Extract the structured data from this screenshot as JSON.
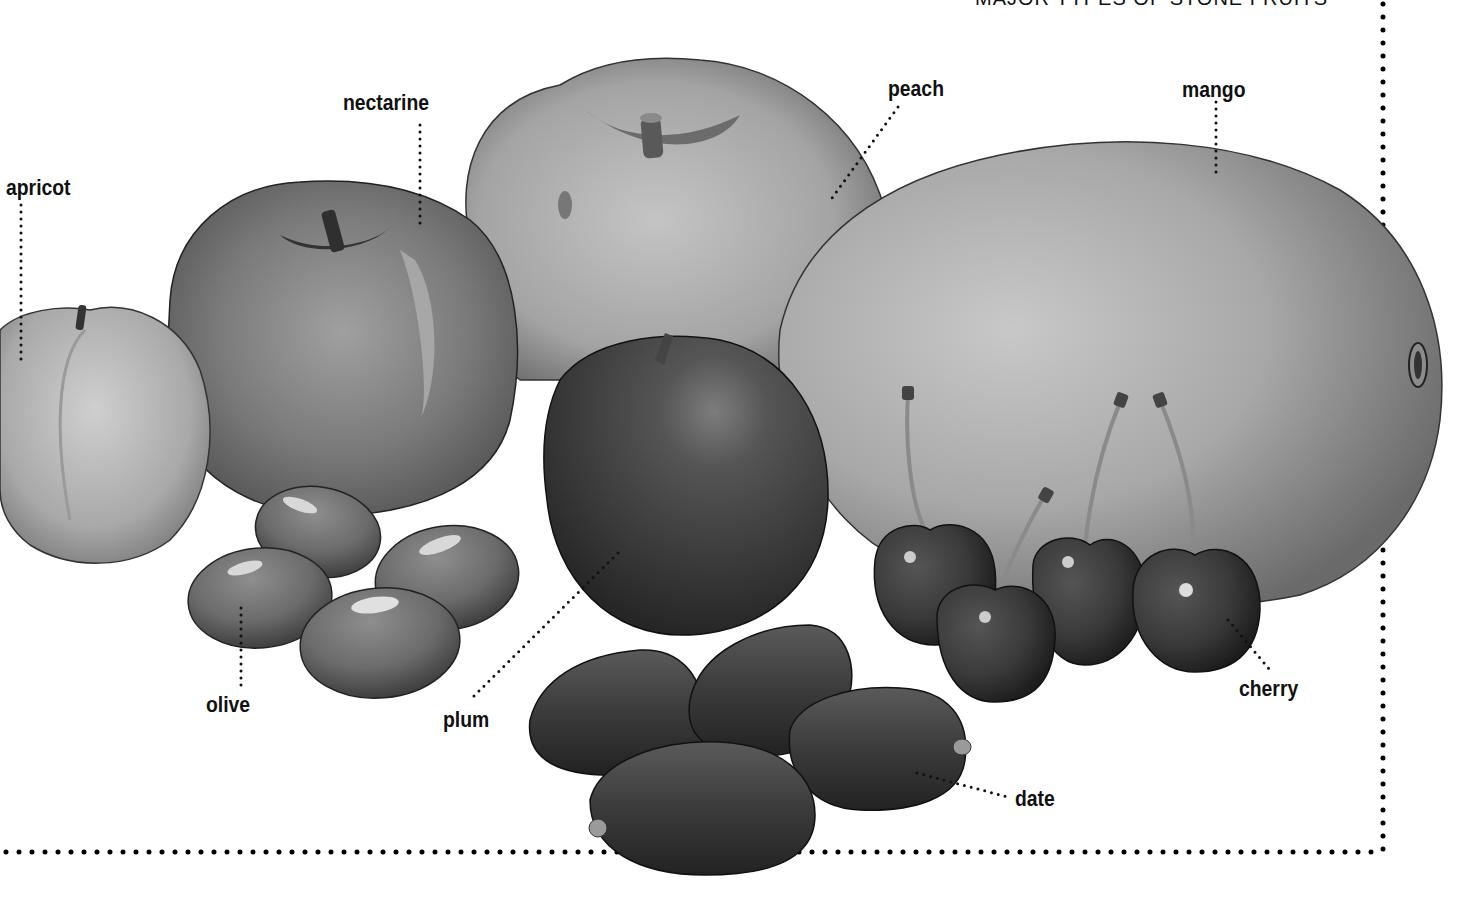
{
  "figure": {
    "title": "MAJOR TYPES OF STONE FRUITS",
    "style": "grayscale illustration",
    "labels": [
      {
        "id": "apricot",
        "text": "apricot",
        "x": 6,
        "y": 175
      },
      {
        "id": "nectarine",
        "text": "nectarine",
        "x": 343,
        "y": 90
      },
      {
        "id": "peach",
        "text": "peach",
        "x": 888,
        "y": 76
      },
      {
        "id": "mango",
        "text": "mango",
        "x": 1182,
        "y": 77
      },
      {
        "id": "olive",
        "text": "olive",
        "x": 206,
        "y": 692
      },
      {
        "id": "plum",
        "text": "plum",
        "x": 443,
        "y": 707
      },
      {
        "id": "cherry",
        "text": "cherry",
        "x": 1239,
        "y": 676
      },
      {
        "id": "date",
        "text": "date",
        "x": 1015,
        "y": 786
      }
    ],
    "colors": {
      "background": "#ffffff",
      "text": "#111111",
      "leader_dots": "#111111",
      "border_dots": "#000000"
    }
  }
}
